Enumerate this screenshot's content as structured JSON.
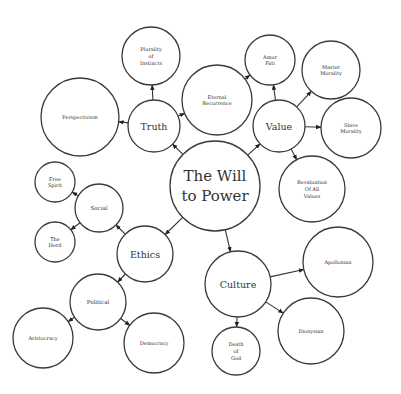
{
  "diagram": {
    "type": "concept-map",
    "colors": {
      "background": "#ffffff",
      "stroke": "#3a3a3a",
      "text": "#333333"
    },
    "nodes": [
      {
        "id": "will",
        "label": [
          "The Will",
          "to Power"
        ],
        "cx": 215,
        "cy": 186,
        "r": 45,
        "fontSize": 15
      },
      {
        "id": "truth",
        "label": [
          "Truth"
        ],
        "cx": 154,
        "cy": 126,
        "r": 26,
        "fontSize": 9.5
      },
      {
        "id": "value",
        "label": [
          "Value"
        ],
        "cx": 279,
        "cy": 126,
        "r": 26,
        "fontSize": 9.5
      },
      {
        "id": "ethics",
        "label": [
          "Ethics"
        ],
        "cx": 145,
        "cy": 254,
        "r": 28,
        "fontSize": 9.5
      },
      {
        "id": "culture",
        "label": [
          "Culture"
        ],
        "cx": 238,
        "cy": 284,
        "r": 33,
        "fontSize": 9.5
      },
      {
        "id": "plurality",
        "label": [
          "Plurality",
          "of",
          "Instincts"
        ],
        "cx": 151,
        "cy": 56,
        "r": 29,
        "fontSize": 5
      },
      {
        "id": "perspectivism",
        "label": [
          "Perspectivism"
        ],
        "cx": 80,
        "cy": 117,
        "r": 39,
        "fontSize": 5
      },
      {
        "id": "eternal",
        "label": [
          "Eternal",
          "Recurrence"
        ],
        "cx": 217,
        "cy": 100,
        "r": 35,
        "fontSize": 5
      },
      {
        "id": "amor",
        "label": [
          "Amor",
          "Fati"
        ],
        "cx": 270,
        "cy": 60,
        "r": 25,
        "fontSize": 5
      },
      {
        "id": "master",
        "label": [
          "Master",
          "Morality"
        ],
        "cx": 331,
        "cy": 70,
        "r": 29,
        "fontSize": 5
      },
      {
        "id": "slave",
        "label": [
          "Slave",
          "Morality"
        ],
        "cx": 351,
        "cy": 128,
        "r": 30,
        "fontSize": 5
      },
      {
        "id": "revaluation",
        "label": [
          "Revaluation",
          "Of All",
          "Values"
        ],
        "cx": 312,
        "cy": 189,
        "r": 33,
        "fontSize": 5
      },
      {
        "id": "social",
        "label": [
          "Social"
        ],
        "cx": 99,
        "cy": 208,
        "r": 24,
        "fontSize": 5.5
      },
      {
        "id": "freespirit",
        "label": [
          "Free",
          "Spirit"
        ],
        "cx": 55,
        "cy": 182,
        "r": 20,
        "fontSize": 5
      },
      {
        "id": "herd",
        "label": [
          "The",
          "Herd"
        ],
        "cx": 55,
        "cy": 242,
        "r": 20,
        "fontSize": 5
      },
      {
        "id": "political",
        "label": [
          "Political"
        ],
        "cx": 98,
        "cy": 302,
        "r": 28,
        "fontSize": 5.5
      },
      {
        "id": "aristocracy",
        "label": [
          "Aristocracy"
        ],
        "cx": 43,
        "cy": 338,
        "r": 30,
        "fontSize": 5
      },
      {
        "id": "democracy",
        "label": [
          "Democracy"
        ],
        "cx": 154,
        "cy": 343,
        "r": 30,
        "fontSize": 5
      },
      {
        "id": "apollonian",
        "label": [
          "Apollonian"
        ],
        "cx": 338,
        "cy": 262,
        "r": 35,
        "fontSize": 5
      },
      {
        "id": "dionysian",
        "label": [
          "Dionysian"
        ],
        "cx": 311,
        "cy": 331,
        "r": 33,
        "fontSize": 5
      },
      {
        "id": "deathofgod",
        "label": [
          "Death",
          "of",
          "God"
        ],
        "cx": 236,
        "cy": 351,
        "r": 24,
        "fontSize": 5
      }
    ],
    "edges": [
      {
        "from": "will",
        "to": "truth"
      },
      {
        "from": "will",
        "to": "value"
      },
      {
        "from": "will",
        "to": "ethics"
      },
      {
        "from": "will",
        "to": "culture"
      },
      {
        "from": "truth",
        "to": "plurality"
      },
      {
        "from": "truth",
        "to": "perspectivism"
      },
      {
        "from": "truth",
        "to": "eternal"
      },
      {
        "from": "eternal",
        "to": "amor"
      },
      {
        "from": "value",
        "to": "amor"
      },
      {
        "from": "value",
        "to": "master"
      },
      {
        "from": "value",
        "to": "slave"
      },
      {
        "from": "value",
        "to": "revaluation"
      },
      {
        "from": "ethics",
        "to": "social"
      },
      {
        "from": "ethics",
        "to": "political"
      },
      {
        "from": "social",
        "to": "freespirit"
      },
      {
        "from": "social",
        "to": "herd"
      },
      {
        "from": "political",
        "to": "aristocracy"
      },
      {
        "from": "political",
        "to": "democracy"
      },
      {
        "from": "culture",
        "to": "apollonian"
      },
      {
        "from": "culture",
        "to": "dionysian"
      },
      {
        "from": "culture",
        "to": "deathofgod"
      }
    ]
  }
}
